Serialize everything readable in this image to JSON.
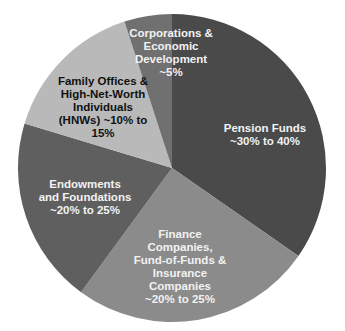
{
  "chart_data": {
    "type": "pie",
    "title": "",
    "center": [
      172,
      168
    ],
    "radius": 154,
    "start_angle_deg": 0,
    "direction": "clockwise",
    "slices": [
      {
        "name": "Pension Funds",
        "label_line1": "Pension Funds",
        "label_line2": "~30% to 40%",
        "range": "~30% to 40%",
        "value": 35,
        "start": 0,
        "end": 124.8,
        "color": "#4a4a4a"
      },
      {
        "name": "Finance Companies, Fund-of-Funds & Insurance Companies",
        "label_text": "Finance\nCompanies,\nFund-of-Funds &\nInsurance\nCompanies\n~20% to 25%",
        "range": "~20% to 25%",
        "value": 25,
        "start": 124.8,
        "end": 216.2,
        "color": "#8b8b8b"
      },
      {
        "name": "Endowments and Foundations",
        "label_text": "Endowments\nand Foundations\n~20% to 25%",
        "range": "~20% to 25%",
        "value": 20,
        "start": 216.2,
        "end": 286.8,
        "color": "#5f5f5f"
      },
      {
        "name": "Family Offices & High-Net-Worth Individuals (HNWs)",
        "label_text": "Family Offices &\nHigh-Net-Worth\nIndividuals\n(HNWs) ~10% to\n15%",
        "range": "~10% to 15%",
        "value": 15,
        "start": 286.8,
        "end": 342,
        "color": "#b9b9b9"
      },
      {
        "name": "Corporations & Economic Development",
        "label_text": "Corporations &\nEconomic\nDevelopment\n~5%",
        "range": "~5%",
        "value": 5,
        "start": 342,
        "end": 360,
        "color": "#707070"
      }
    ],
    "legend": "none"
  },
  "labels": {
    "pension": "Pension Funds\n~30% to 40%",
    "finance": "Finance\nCompanies,\nFund-of-Funds &\nInsurance\nCompanies\n~20% to 25%",
    "endowments": "Endowments\nand Foundations\n~20% to 25%",
    "family": "Family Offices &\nHigh-Net-Worth\nIndividuals\n(HNWs) ~10% to\n15%",
    "corporations": "Corporations &\nEconomic\nDevelopment\n~5%"
  }
}
